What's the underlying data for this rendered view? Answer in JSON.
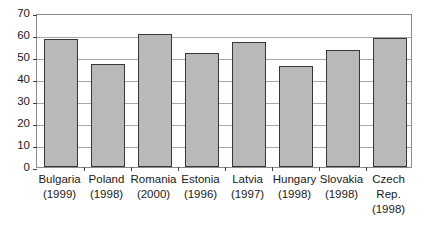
{
  "chart_data": {
    "type": "bar",
    "title": "",
    "subtitle": "",
    "xlabel": "",
    "ylabel": "",
    "ylim": [
      0,
      70
    ],
    "ytick_step": 10,
    "yticks": [
      0,
      10,
      20,
      30,
      40,
      50,
      60,
      70
    ],
    "grid": true,
    "legend": false,
    "legend_position": "none",
    "categories": [
      "Bulgaria\n(1999)",
      "Poland\n(1998)",
      "Romania\n(2000)",
      "Estonia\n(1996)",
      "Latvia\n(1997)",
      "Hungary\n(1998)",
      "Slovakia\n(1998)",
      "Czech\nRep.\n(1998)"
    ],
    "category_names": [
      "Bulgaria",
      "Poland",
      "Romania",
      "Estonia",
      "Latvia",
      "Hungary",
      "Slovakia",
      "Czech Rep."
    ],
    "category_years": [
      "(1999)",
      "(1998)",
      "(2000)",
      "(1996)",
      "(1997)",
      "(1998)",
      "(1998)",
      "(1998)"
    ],
    "values": [
      58,
      47,
      60.5,
      52,
      57,
      46,
      53,
      58.5
    ],
    "series": [
      {
        "name": "",
        "values": [
          58,
          47,
          60.5,
          52,
          57,
          46,
          53,
          58.5
        ]
      }
    ],
    "colors": {
      "bar_fill": "#b9b9b9",
      "bar_border": "#33383c",
      "gridline": "#a8a8a8",
      "plot_border": "#8a8a8a",
      "text": "#1a1a1a",
      "background": "#ffffff"
    }
  }
}
